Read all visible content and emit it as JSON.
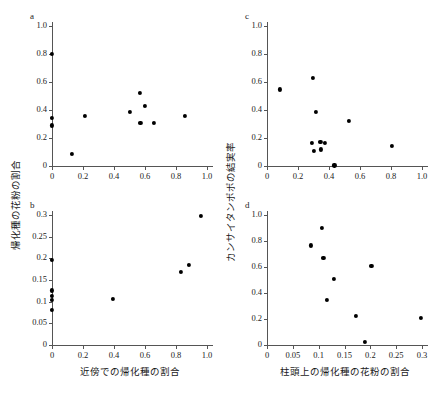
{
  "figure": {
    "panels": [
      "a",
      "b",
      "c",
      "d"
    ],
    "axis_titles": {
      "left_y": "帰化種の花粉の割合",
      "right_y": "カンサイタンポポの結実率",
      "left_x": "近傍での帰化種の割合",
      "right_x": "柱頭上の帰化種の花粉の割合"
    }
  },
  "chart_data": [
    {
      "type": "scatter",
      "panel": "a",
      "title": "a",
      "xlabel": "近傍での帰化種の割合",
      "ylabel": "帰化種の花粉の割合",
      "xlim": [
        0,
        1.0
      ],
      "ylim": [
        0,
        1.0
      ],
      "xticks": [
        0,
        0.2,
        0.4,
        0.6,
        0.8,
        1.0
      ],
      "xticklabels": [
        "0",
        "0.2",
        "0.4",
        "0.6",
        "0.8",
        "1.0"
      ],
      "yticks": [
        0,
        0.2,
        0.4,
        0.6,
        0.8,
        1.0
      ],
      "yticklabels": [
        "0",
        "0.2",
        "0.4",
        "0.6",
        "0.8",
        "1.0"
      ],
      "grid": false,
      "legend": null,
      "x": [
        0.0,
        0.0,
        0.0,
        0.13,
        0.21,
        0.5,
        0.565,
        0.57,
        0.6,
        0.66,
        0.855
      ],
      "y": [
        0.8,
        0.345,
        0.29,
        0.085,
        0.36,
        0.385,
        0.525,
        0.31,
        0.43,
        0.305,
        0.36
      ]
    },
    {
      "type": "scatter",
      "panel": "b",
      "title": "b",
      "xlabel": "近傍での帰化種の割合",
      "ylabel": "帰化種の花粉の割合",
      "xlim": [
        0,
        1.0
      ],
      "ylim": [
        0,
        0.3
      ],
      "xticks": [
        0,
        0.2,
        0.4,
        0.6,
        0.8,
        1.0
      ],
      "xticklabels": [
        "0",
        "0.2",
        "0.4",
        "0.6",
        "0.8",
        "1.0"
      ],
      "yticks": [
        0,
        0.05,
        0.1,
        0.15,
        0.2,
        0.25,
        0.3
      ],
      "yticklabels": [
        "0",
        "0.05",
        "0.1",
        "0.15",
        "0.2",
        "0.25",
        "0.3"
      ],
      "grid": false,
      "legend": null,
      "x": [
        0.0,
        0.0,
        0.0,
        0.0,
        0.0,
        0.395,
        0.83,
        0.885,
        0.96
      ],
      "y": [
        0.197,
        0.126,
        0.113,
        0.105,
        0.081,
        0.106,
        0.168,
        0.185,
        0.297
      ]
    },
    {
      "type": "scatter",
      "panel": "c",
      "title": "c",
      "xlabel": "柱頭上の帰化種の花粉の割合",
      "ylabel": "カンサイタンポポの結実率",
      "xlim": [
        0,
        1.0
      ],
      "ylim": [
        0,
        1.0
      ],
      "xticks": [
        0,
        0.2,
        0.4,
        0.6,
        0.8,
        1.0
      ],
      "xticklabels": [
        "0",
        "0.2",
        "0.4",
        "0.6",
        "0.8",
        "1.0"
      ],
      "yticks": [
        0,
        0.2,
        0.4,
        0.6,
        0.8,
        1.0
      ],
      "yticklabels": [
        "0",
        "0.2",
        "0.4",
        "0.6",
        "0.8",
        "1.0"
      ],
      "grid": false,
      "legend": null,
      "x": [
        0.085,
        0.295,
        0.315,
        0.29,
        0.3,
        0.345,
        0.35,
        0.375,
        0.435,
        0.53,
        0.805
      ],
      "y": [
        0.547,
        0.632,
        0.385,
        0.163,
        0.107,
        0.172,
        0.118,
        0.165,
        0.004,
        0.323,
        0.143
      ]
    },
    {
      "type": "scatter",
      "panel": "d",
      "title": "d",
      "xlabel": "柱頭上の帰化種の花粉の割合",
      "ylabel": "カンサイタンポポの結実率",
      "xlim": [
        0,
        0.3
      ],
      "ylim": [
        0,
        1.0
      ],
      "xticks": [
        0,
        0.05,
        0.1,
        0.15,
        0.2,
        0.25,
        0.3
      ],
      "xticklabels": [
        "0",
        "0.05",
        "0.1",
        "0.15",
        "0.2",
        "0.25",
        "0.3"
      ],
      "yticks": [
        0,
        0.2,
        0.4,
        0.6,
        0.8,
        1.0
      ],
      "yticklabels": [
        "0",
        "0.2",
        "0.4",
        "0.6",
        "0.8",
        "1.0"
      ],
      "grid": false,
      "legend": null,
      "x": [
        0.085,
        0.107,
        0.109,
        0.116,
        0.129,
        0.172,
        0.189,
        0.202,
        0.298
      ],
      "y": [
        0.766,
        0.901,
        0.668,
        0.344,
        0.506,
        0.221,
        0.021,
        0.606,
        0.207
      ]
    }
  ]
}
